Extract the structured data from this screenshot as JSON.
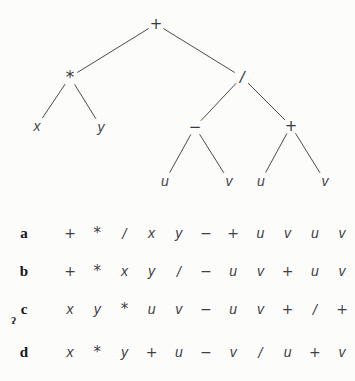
{
  "figure": {
    "type": "expression-tree-with-traversal-sequences",
    "tree": {
      "nodes": [
        {
          "id": "root",
          "label": "+",
          "kind": "operator",
          "x": 156,
          "y": 24
        },
        {
          "id": "times",
          "label": "*",
          "kind": "operator",
          "x": 70,
          "y": 77
        },
        {
          "id": "slash",
          "label": "/",
          "kind": "operator",
          "x": 242,
          "y": 77
        },
        {
          "id": "leaf-x",
          "label": "x",
          "kind": "leaf",
          "x": 37,
          "y": 126
        },
        {
          "id": "leaf-y",
          "label": "y",
          "kind": "leaf",
          "x": 101,
          "y": 127
        },
        {
          "id": "minus",
          "label": "−",
          "kind": "operator",
          "x": 195,
          "y": 127
        },
        {
          "id": "plus2",
          "label": "+",
          "kind": "operator",
          "x": 291,
          "y": 126
        },
        {
          "id": "leaf-u1",
          "label": "u",
          "kind": "leaf",
          "x": 165,
          "y": 181
        },
        {
          "id": "leaf-v1",
          "label": "v",
          "kind": "leaf",
          "x": 229,
          "y": 181
        },
        {
          "id": "leaf-u2",
          "label": "u",
          "kind": "leaf",
          "x": 261,
          "y": 181
        },
        {
          "id": "leaf-v2",
          "label": "v",
          "kind": "leaf",
          "x": 325,
          "y": 181
        }
      ],
      "edges": [
        {
          "from": "root",
          "to": "times"
        },
        {
          "from": "root",
          "to": "slash"
        },
        {
          "from": "times",
          "to": "leaf-x"
        },
        {
          "from": "times",
          "to": "leaf-y"
        },
        {
          "from": "slash",
          "to": "minus"
        },
        {
          "from": "slash",
          "to": "plus2"
        },
        {
          "from": "minus",
          "to": "leaf-u1"
        },
        {
          "from": "minus",
          "to": "leaf-v1"
        },
        {
          "from": "plus2",
          "to": "leaf-u2"
        },
        {
          "from": "plus2",
          "to": "leaf-v2"
        }
      ],
      "edge_color": "#4a4a50"
    },
    "rows": [
      {
        "label": "a",
        "baseline_y": 23,
        "tokens": [
          "+",
          "*",
          "/",
          "x",
          "y",
          "−",
          "+",
          "u",
          "v",
          "u",
          "v"
        ]
      },
      {
        "label": "b",
        "baseline_y": 61,
        "tokens": [
          "+",
          "*",
          "x",
          "y",
          "/",
          "−",
          "u",
          "v",
          "+",
          "u",
          "v"
        ]
      },
      {
        "label": "c",
        "baseline_y": 99,
        "tokens": [
          "x",
          "y",
          "*",
          "u",
          "v",
          "−",
          "u",
          "v",
          "+",
          "/",
          "+"
        ]
      },
      {
        "label": "d",
        "baseline_y": 142,
        "tokens": [
          "x",
          "*",
          "y",
          "+",
          "u",
          "−",
          "v",
          "/",
          "u",
          "+",
          "v"
        ]
      }
    ],
    "artifacts": {
      "speck": "ʔ"
    }
  }
}
